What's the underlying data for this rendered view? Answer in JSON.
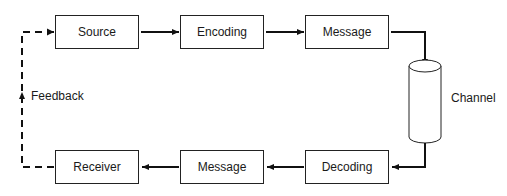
{
  "diagram": {
    "type": "communication-process-flow",
    "nodes": [
      {
        "id": "source",
        "label": "Source"
      },
      {
        "id": "encoding",
        "label": "Encoding"
      },
      {
        "id": "message_top",
        "label": "Message"
      },
      {
        "id": "channel",
        "label": "Channel",
        "shape": "cylinder"
      },
      {
        "id": "decoding",
        "label": "Decoding"
      },
      {
        "id": "message_bottom",
        "label": "Message"
      },
      {
        "id": "receiver",
        "label": "Receiver"
      }
    ],
    "edges": [
      {
        "from": "source",
        "to": "encoding",
        "style": "solid"
      },
      {
        "from": "encoding",
        "to": "message_top",
        "style": "solid"
      },
      {
        "from": "message_top",
        "to": "channel",
        "style": "solid"
      },
      {
        "from": "channel",
        "to": "decoding",
        "style": "solid"
      },
      {
        "from": "decoding",
        "to": "message_bottom",
        "style": "solid"
      },
      {
        "from": "message_bottom",
        "to": "receiver",
        "style": "solid"
      },
      {
        "from": "receiver",
        "to": "source",
        "style": "dashed",
        "label": "Feedback"
      }
    ],
    "feedback_label": "Feedback"
  }
}
